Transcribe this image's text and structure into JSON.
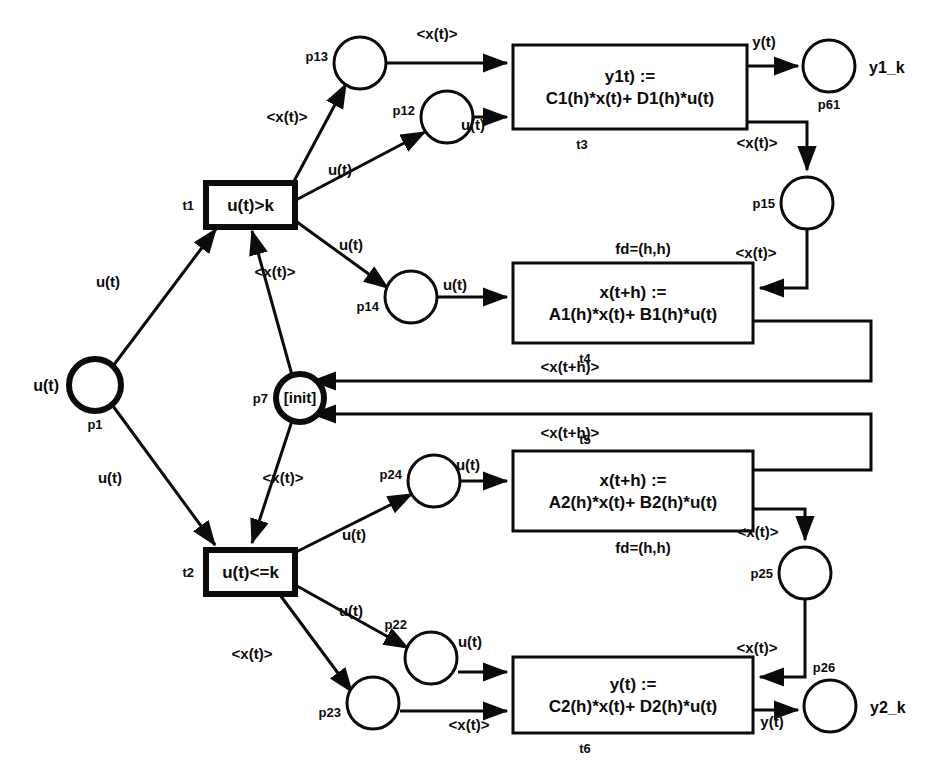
{
  "diagram": {
    "type": "petri-net",
    "places": [
      {
        "id": "p1",
        "label": "p1",
        "ext": "u(t)",
        "cx": 95,
        "cy": 385,
        "r": 26,
        "thick": true,
        "inner": ""
      },
      {
        "id": "p7",
        "label": "p7",
        "ext": "",
        "cx": 300,
        "cy": 398,
        "r": 24,
        "thick": true,
        "inner": "[init]"
      },
      {
        "id": "p12",
        "label": "p12",
        "ext": "",
        "cx": 447,
        "cy": 117,
        "r": 26,
        "thick": false,
        "inner": ""
      },
      {
        "id": "p13",
        "label": "p13",
        "ext": "",
        "cx": 360,
        "cy": 63,
        "r": 26,
        "thick": false,
        "inner": ""
      },
      {
        "id": "p14",
        "label": "p14",
        "ext": "",
        "cx": 411,
        "cy": 297,
        "r": 26,
        "thick": false,
        "inner": ""
      },
      {
        "id": "p15",
        "label": "p15",
        "ext": "",
        "cx": 807,
        "cy": 203,
        "r": 26,
        "thick": false,
        "inner": ""
      },
      {
        "id": "p61",
        "label": "p61",
        "ext": "y1_k",
        "cx": 829,
        "cy": 66,
        "r": 26,
        "thick": false,
        "inner": ""
      },
      {
        "id": "p22",
        "label": "p22",
        "ext": "",
        "cx": 431,
        "cy": 658,
        "r": 26,
        "thick": false,
        "inner": ""
      },
      {
        "id": "p23",
        "label": "p23",
        "ext": "",
        "cx": 373,
        "cy": 703,
        "r": 26,
        "thick": false,
        "inner": ""
      },
      {
        "id": "p24",
        "label": "p24",
        "ext": "",
        "cx": 434,
        "cy": 481,
        "r": 26,
        "thick": false,
        "inner": ""
      },
      {
        "id": "p25",
        "label": "p25",
        "ext": "",
        "cx": 805,
        "cy": 573,
        "r": 26,
        "thick": false,
        "inner": ""
      },
      {
        "id": "p26",
        "label": "p26",
        "ext": "y2_k",
        "cx": 830,
        "cy": 706,
        "r": 26,
        "thick": false,
        "inner": ""
      }
    ],
    "transitions": [
      {
        "id": "t1",
        "label": "t1",
        "style": "guard",
        "text": [
          "u(t)>k"
        ],
        "x": 206,
        "y": 183,
        "w": 89,
        "h": 44,
        "id_pos": "left"
      },
      {
        "id": "t2",
        "label": "t2",
        "style": "guard",
        "text": [
          "u(t)<=k"
        ],
        "x": 206,
        "y": 550,
        "w": 89,
        "h": 44,
        "id_pos": "left"
      },
      {
        "id": "t3",
        "label": "t3",
        "style": "plain",
        "text": [
          "y1t) :=",
          "C1(h)*x(t)+ D1(h)*u(t)"
        ],
        "x": 513,
        "y": 45,
        "w": 234,
        "h": 84,
        "id_pos": "below",
        "extra": "",
        "extra_pos": ""
      },
      {
        "id": "t4",
        "label": "t4",
        "style": "plain",
        "text": [
          "x(t+h) :=",
          "A1(h)*x(t)+ B1(h)*u(t)"
        ],
        "x": 513,
        "y": 263,
        "w": 240,
        "h": 80,
        "id_pos": "below",
        "extra": "fd=(h,h)",
        "extra_pos": "above"
      },
      {
        "id": "t5",
        "label": "t5",
        "style": "plain",
        "text": [
          "x(t+h) :=",
          "A2(h)*x(t)+ B2(h)*u(t)"
        ],
        "x": 513,
        "y": 451,
        "w": 240,
        "h": 80,
        "id_pos": "above",
        "extra": "fd=(h,h)",
        "extra_pos": "below"
      },
      {
        "id": "t6",
        "label": "t6",
        "style": "plain",
        "text": [
          "y(t) :=",
          "C2(h)*x(t)+ D2(h)*u(t)"
        ],
        "x": 513,
        "y": 657,
        "w": 240,
        "h": 76,
        "id_pos": "below",
        "extra": "",
        "extra_pos": ""
      }
    ],
    "arc_labels": [
      {
        "key": "a1",
        "text": "<x(t)>",
        "x": 437,
        "y": 39
      },
      {
        "key": "a2",
        "text": "<x(t)>",
        "x": 287,
        "y": 122
      },
      {
        "key": "a3",
        "text": "u(t)",
        "x": 340,
        "y": 175
      },
      {
        "key": "a4",
        "text": "u(t)",
        "x": 473,
        "y": 130
      },
      {
        "key": "a5",
        "text": "y(t)",
        "x": 764,
        "y": 47
      },
      {
        "key": "a6",
        "text": "<x(t)>",
        "x": 757,
        "y": 148
      },
      {
        "key": "a7",
        "text": "u(t)",
        "x": 351,
        "y": 250
      },
      {
        "key": "a8",
        "text": "u(t)",
        "x": 455,
        "y": 290
      },
      {
        "key": "a9",
        "text": "fd_top",
        "x": 0,
        "y": 0
      },
      {
        "key": "a10",
        "text": "<x(t)>",
        "x": 756,
        "y": 258
      },
      {
        "key": "a11",
        "text": "u(t)",
        "x": 108,
        "y": 287
      },
      {
        "key": "a12",
        "text": "<x(t)>",
        "x": 275,
        "y": 277
      },
      {
        "key": "a13",
        "text": "<x(t+h)>",
        "x": 570,
        "y": 372
      },
      {
        "key": "a14",
        "text": "<x(t+h)>",
        "x": 570,
        "y": 438
      },
      {
        "key": "a15",
        "text": "u(t)",
        "x": 110,
        "y": 483
      },
      {
        "key": "a16",
        "text": "<x(t)>",
        "x": 283,
        "y": 483
      },
      {
        "key": "a17",
        "text": "u(t)",
        "x": 354,
        "y": 540
      },
      {
        "key": "a18",
        "text": "u(t)",
        "x": 468,
        "y": 470
      },
      {
        "key": "a19",
        "text": "u(t)",
        "x": 351,
        "y": 616
      },
      {
        "key": "a20",
        "text": "u(t)",
        "x": 470,
        "y": 647
      },
      {
        "key": "a21",
        "text": "<x(t)>",
        "x": 758,
        "y": 537
      },
      {
        "key": "a22",
        "text": "<x(t)>",
        "x": 252,
        "y": 659
      },
      {
        "key": "a23",
        "text": "<x(t)>",
        "x": 469,
        "y": 730
      },
      {
        "key": "a24",
        "text": "<x(t)>",
        "x": 757,
        "y": 653
      },
      {
        "key": "a25",
        "text": "y(t)",
        "x": 772,
        "y": 727
      }
    ]
  }
}
